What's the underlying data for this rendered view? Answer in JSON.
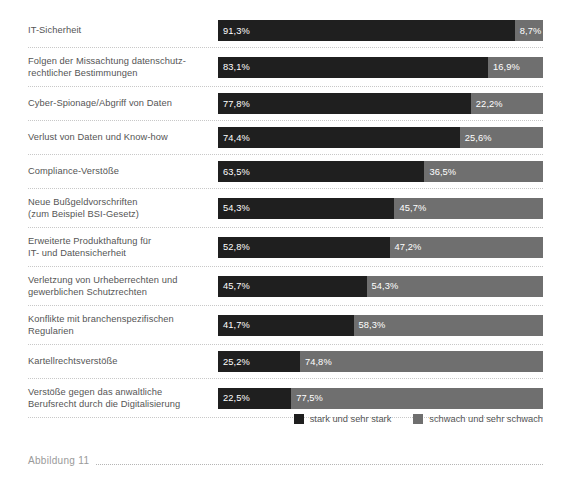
{
  "chart_data": {
    "type": "bar",
    "orientation": "horizontal",
    "stacked": true,
    "normalized_total": 100,
    "title": "",
    "subtitle": "",
    "xlabel": "",
    "ylabel": "",
    "xlim": [
      0,
      100
    ],
    "grid": false,
    "legend_position": "bottom-right",
    "value_suffix": "%",
    "decimal_separator": ",",
    "categories": [
      "IT-Sicherheit",
      "Folgen der Missachtung datenschutz-\nrechtlicher Bestimmungen",
      "Cyber-Spionage/Abgriff von Daten",
      "Verlust von Daten und Know-how",
      "Compliance-Verstöße",
      "Neue Bußgeldvorschriften\n(zum Beispiel BSI-Gesetz)",
      "Erweiterte Produkthaftung für\nIT- und Datensicherheit",
      "Verletzung von Urheberrechten und\ngewerblichen Schutzrechten",
      "Konflikte mit branchenspezifischen\nRegularien",
      "Kartellrechtsverstöße",
      "Verstöße gegen das anwaltliche\nBerufsrecht durch die Digitalisierung"
    ],
    "series": [
      {
        "name": "stark und sehr stark",
        "color": "#1f1f1f",
        "values": [
          91.3,
          83.1,
          77.8,
          74.4,
          63.5,
          54.3,
          52.8,
          45.7,
          41.7,
          25.2,
          22.5
        ],
        "labels": [
          "91,3%",
          "83,1%",
          "77,8%",
          "74,4%",
          "63,5%",
          "54,3%",
          "52,8%",
          "45,7%",
          "41,7%",
          "25,2%",
          "22,5%"
        ]
      },
      {
        "name": "schwach und sehr schwach",
        "color": "#6f6f6f",
        "values": [
          8.7,
          16.9,
          22.2,
          25.6,
          36.5,
          45.7,
          47.2,
          54.3,
          58.3,
          74.8,
          77.5
        ],
        "labels": [
          "8,7%",
          "16,9%",
          "22,2%",
          "25,6%",
          "36,5%",
          "45,7%",
          "47,2%",
          "54,3%",
          "58,3%",
          "74,8%",
          "77,5%"
        ]
      }
    ]
  },
  "rows": [
    {
      "label": "IT-Sicherheit",
      "lines": 1,
      "strong": 91.3,
      "weak": 8.7,
      "strong_label": "91,3%",
      "weak_label": "8,7%"
    },
    {
      "label": "Folgen der Missachtung datenschutz-\nrechtlicher Bestimmungen",
      "lines": 2,
      "strong": 83.1,
      "weak": 16.9,
      "strong_label": "83,1%",
      "weak_label": "16,9%"
    },
    {
      "label": "Cyber-Spionage/Abgriff von Daten",
      "lines": 1,
      "strong": 77.8,
      "weak": 22.2,
      "strong_label": "77,8%",
      "weak_label": "22,2%"
    },
    {
      "label": "Verlust von Daten und Know-how",
      "lines": 1,
      "strong": 74.4,
      "weak": 25.6,
      "strong_label": "74,4%",
      "weak_label": "25,6%"
    },
    {
      "label": "Compliance-Verstöße",
      "lines": 1,
      "strong": 63.5,
      "weak": 36.5,
      "strong_label": "63,5%",
      "weak_label": "36,5%"
    },
    {
      "label": "Neue Bußgeldvorschriften\n(zum Beispiel BSI-Gesetz)",
      "lines": 2,
      "strong": 54.3,
      "weak": 45.7,
      "strong_label": "54,3%",
      "weak_label": "45,7%"
    },
    {
      "label": "Erweiterte Produkthaftung für\nIT- und Datensicherheit",
      "lines": 2,
      "strong": 52.8,
      "weak": 47.2,
      "strong_label": "52,8%",
      "weak_label": "47,2%"
    },
    {
      "label": "Verletzung von Urheberrechten und\ngewerblichen Schutzrechten",
      "lines": 2,
      "strong": 45.7,
      "weak": 54.3,
      "strong_label": "45,7%",
      "weak_label": "54,3%"
    },
    {
      "label": "Konflikte mit branchenspezifischen\nRegularien",
      "lines": 2,
      "strong": 41.7,
      "weak": 58.3,
      "strong_label": "41,7%",
      "weak_label": "58,3%"
    },
    {
      "label": "Kartellrechtsverstöße",
      "lines": 1,
      "strong": 25.2,
      "weak": 74.8,
      "strong_label": "25,2%",
      "weak_label": "74,8%"
    },
    {
      "label": "Verstöße gegen das anwaltliche\nBerufsrecht durch die Digitalisierung",
      "lines": 2,
      "strong": 22.5,
      "weak": 77.5,
      "strong_label": "22,5%",
      "weak_label": "77,5%"
    }
  ],
  "legend": {
    "items": [
      {
        "label": "stark und sehr stark",
        "color": "#1f1f1f"
      },
      {
        "label": "schwach und sehr schwach",
        "color": "#6f6f6f"
      }
    ]
  },
  "caption": {
    "text": "Abbildung 11"
  },
  "colors": {
    "strong": "#1f1f1f",
    "weak": "#6f6f6f",
    "label_text": "#555555",
    "value_text": "#ffffff",
    "separator": "#c8c8c8",
    "caption_text": "#9a9a9a",
    "background": "#ffffff"
  }
}
